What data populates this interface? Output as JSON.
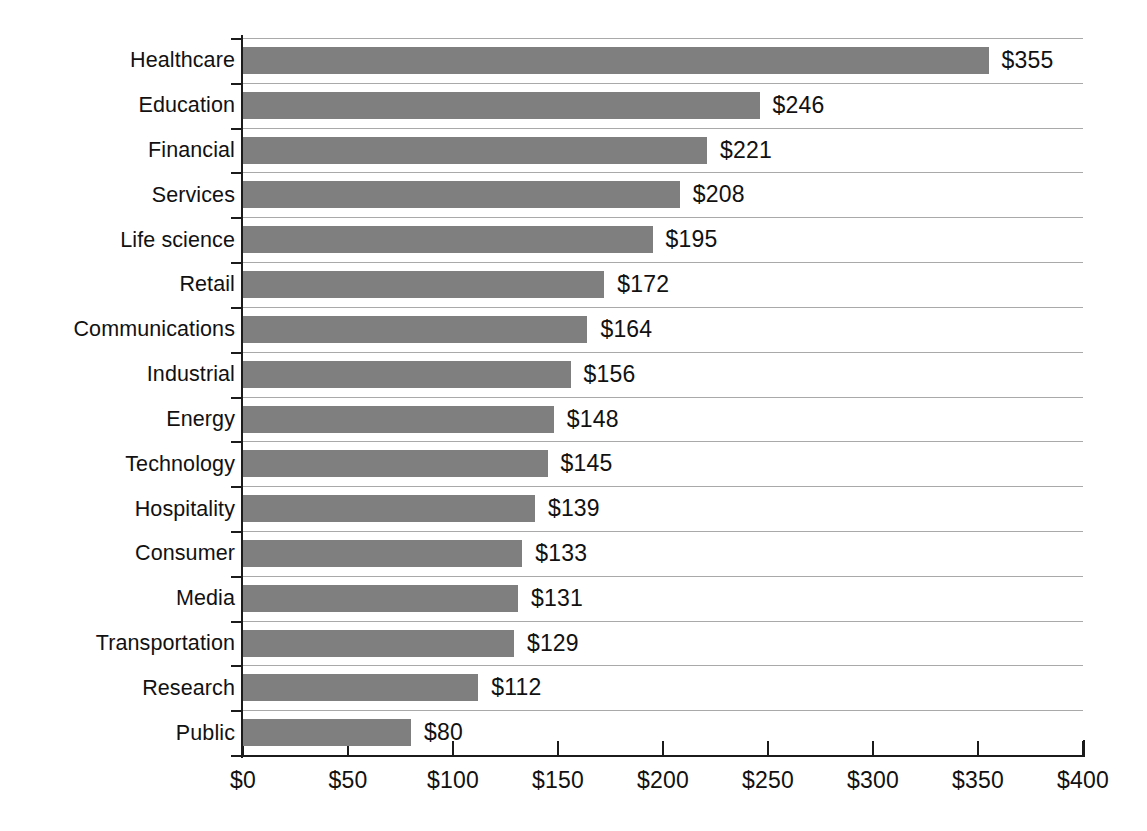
{
  "chart_data": {
    "type": "bar",
    "orientation": "horizontal",
    "title": "",
    "subtitle": "",
    "xlabel": "",
    "ylabel": "",
    "xlim": [
      0,
      400
    ],
    "xtick_values": [
      0,
      50,
      100,
      150,
      200,
      250,
      300,
      350,
      400
    ],
    "xtick_labels": [
      "$0",
      "$50",
      "$100",
      "$150",
      "$200",
      "$250",
      "$300",
      "$350",
      "$400"
    ],
    "grid": true,
    "grid_axis": "y",
    "legend": false,
    "value_prefix": "$",
    "bar_color": "#7f7f7f",
    "gridline_color": "#a9a9a9",
    "axis_color": "#1b1b1b",
    "categories": [
      "Healthcare",
      "Education",
      "Financial",
      "Services",
      "Life science",
      "Retail",
      "Communications",
      "Industrial",
      "Energy",
      "Technology",
      "Hospitality",
      "Consumer",
      "Media",
      "Transportation",
      "Research",
      "Public"
    ],
    "values": [
      355,
      246,
      221,
      208,
      195,
      172,
      164,
      156,
      148,
      145,
      139,
      133,
      131,
      129,
      112,
      80
    ],
    "value_labels": [
      "$355",
      "$246",
      "$221",
      "$208",
      "$195",
      "$172",
      "$164",
      "$156",
      "$148",
      "$145",
      "$139",
      "$133",
      "$131",
      "$129",
      "$112",
      "$80"
    ]
  }
}
